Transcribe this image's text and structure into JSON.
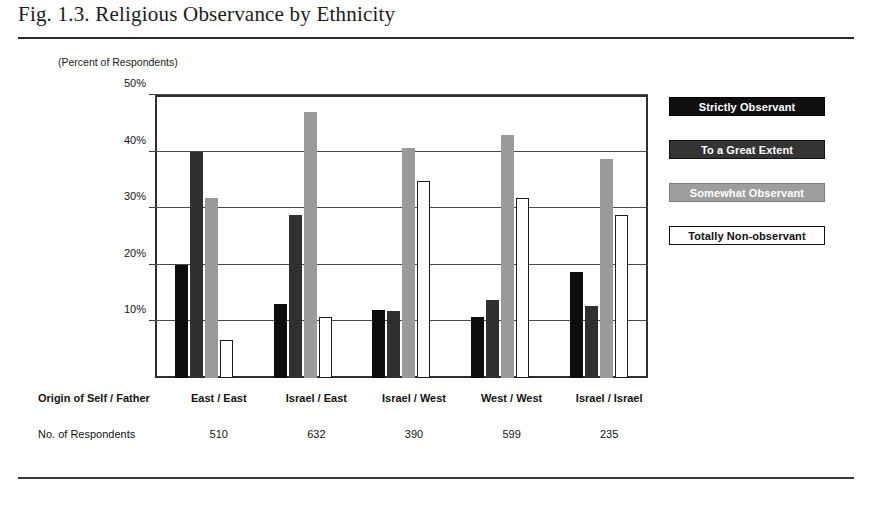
{
  "figure": {
    "title": "Fig. 1.3. Religious Observance by Ethnicity",
    "axis_caption": "(Percent of Respondents)"
  },
  "footer": {
    "origin_label": "Origin of Self / Father",
    "respondents_label": "No. of Respondents"
  },
  "colors": {
    "strictly_observant": "#0d0d0d",
    "to_a_great_extent": "#303030",
    "somewhat_observant": "#9a9a9a",
    "totally_non_observant": "#ffffff",
    "frame": "#2f2f2f",
    "rule": "#2b2b2b"
  },
  "chart_data": {
    "type": "bar",
    "title": "Fig. 1.3. Religious Observance by Ethnicity",
    "subtitle": "(Percent of Respondents)",
    "xlabel": "Origin of Self / Father",
    "ylabel": "Percent of Respondents",
    "ylim": [
      0,
      50
    ],
    "yticks": [
      10,
      20,
      30,
      40,
      50
    ],
    "ytick_labels": [
      "10%",
      "20%",
      "30%",
      "40%",
      "50%"
    ],
    "grid": true,
    "legend_position": "right",
    "categories": [
      "East / East",
      "Israel / East",
      "Israel / West",
      "West / West",
      "Israel / Israel"
    ],
    "respondents": [
      510,
      632,
      390,
      599,
      235
    ],
    "series": [
      {
        "name": "Strictly Observant",
        "values": [
          20.0,
          13.0,
          12.0,
          10.7,
          18.7
        ]
      },
      {
        "name": "To a Great Extent",
        "values": [
          40.0,
          28.8,
          11.9,
          13.7,
          12.7
        ]
      },
      {
        "name": "Somewhat Observant",
        "values": [
          31.8,
          47.0,
          40.7,
          43.0,
          38.7
        ]
      },
      {
        "name": "Totally Non-observant",
        "values": [
          6.8,
          10.7,
          34.8,
          31.8,
          28.8
        ]
      }
    ]
  }
}
